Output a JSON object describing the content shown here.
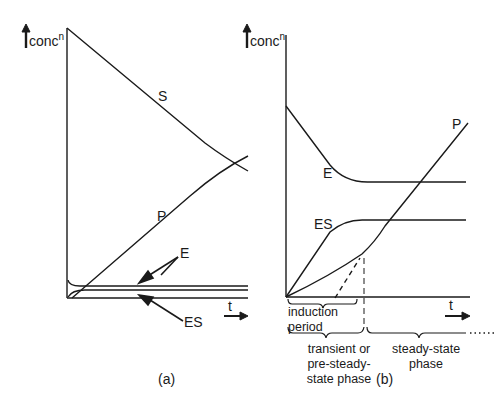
{
  "figure": {
    "panel_a": {
      "caption": "(a)",
      "y_axis_label": "conc",
      "y_axis_sup": "n",
      "x_axis_label": "t",
      "curves": {
        "S": "S",
        "P": "P",
        "E": "E",
        "ES": "ES"
      }
    },
    "panel_b": {
      "caption": "(b)",
      "y_axis_label": "conc",
      "y_axis_sup": "n",
      "x_axis_label": "t",
      "curves": {
        "E": "E",
        "ES": "ES",
        "P": "P"
      },
      "annotations": {
        "induction_1": "induction",
        "induction_2": "period",
        "transient_1": "transient or",
        "transient_2": "pre-steady-",
        "transient_3": "state phase",
        "steady_1": "steady-state",
        "steady_2": "phase"
      }
    },
    "line_color": "#1a1a1a"
  }
}
